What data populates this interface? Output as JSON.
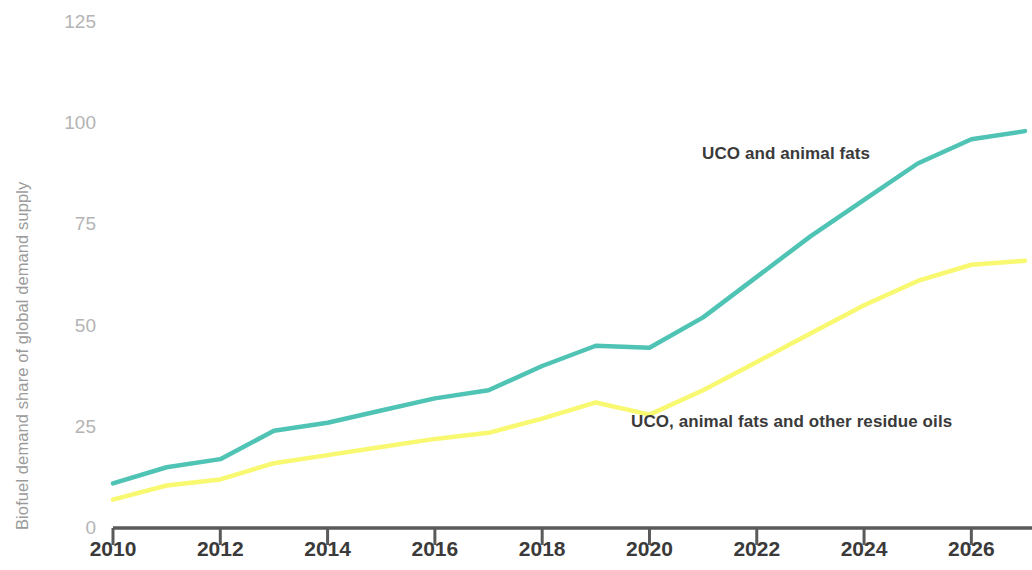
{
  "chart_data": {
    "type": "line",
    "title": "",
    "xlabel": "",
    "ylabel": "Biofuel demand share of global demand supply",
    "x": [
      2010,
      2011,
      2012,
      2013,
      2014,
      2015,
      2016,
      2017,
      2018,
      2019,
      2020,
      2021,
      2022,
      2023,
      2024,
      2025,
      2026,
      2027
    ],
    "xlim": [
      2010,
      2027
    ],
    "ylim": [
      0,
      125
    ],
    "grid": false,
    "legend_position": "inline-annotation",
    "x_tick_labels": [
      "2010",
      "2012",
      "2014",
      "2016",
      "2018",
      "2020",
      "2022",
      "2024",
      "2026"
    ],
    "x_ticks": [
      2010,
      2012,
      2014,
      2016,
      2018,
      2020,
      2022,
      2024,
      2026
    ],
    "y_tick_labels": [
      "0",
      "25",
      "50",
      "75",
      "100",
      "125"
    ],
    "y_ticks": [
      0,
      25,
      50,
      75,
      100,
      125
    ],
    "series": [
      {
        "name": "UCO and animal fats",
        "color": "#4FC3B4",
        "values": [
          11,
          15,
          17,
          24,
          26,
          29,
          32,
          34,
          40,
          45,
          44.5,
          52,
          62,
          72,
          81,
          90,
          96,
          98
        ]
      },
      {
        "name": "UCO, animal fats and other residue oils",
        "color": "#F8F871",
        "values": [
          7,
          10.5,
          12,
          16,
          18,
          20,
          22,
          23.5,
          27,
          31,
          28,
          34,
          41,
          48,
          55,
          61,
          65,
          66
        ]
      }
    ],
    "annotations": [
      {
        "text": "UCO and animal fats",
        "x_px": 702,
        "y_px": 144
      },
      {
        "text": "UCO, animal fats and other residue oils",
        "x_px": 631,
        "y_px": 412
      }
    ],
    "colors": {
      "teal": "#4FC3B4",
      "yellow": "#F8F871",
      "axis": "#5a5a5a",
      "tick_text": "#3a3a3a",
      "y_tick_text": "#b4b4b4",
      "axis_title_text": "#9b9b9b",
      "background": "#ffffff"
    }
  }
}
